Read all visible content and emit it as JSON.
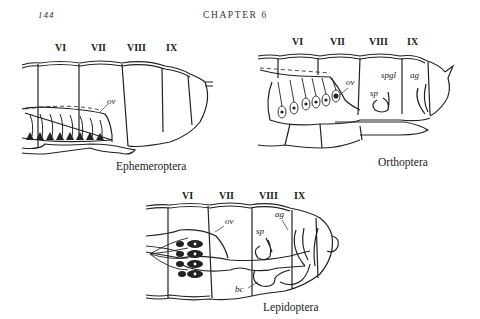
{
  "header": {
    "page_number": "144",
    "chapter_title": "CHAPTER 6"
  },
  "figures": [
    {
      "caption": "Ephemeroptera",
      "segments": [
        "VI",
        "VII",
        "VIII",
        "IX"
      ],
      "labels": {
        "ov": "ov"
      }
    },
    {
      "caption": "Orthoptera",
      "segments": [
        "VI",
        "VII",
        "VIII",
        "IX"
      ],
      "labels": {
        "ov": "ov",
        "spgl": "spgl",
        "sp": "sp",
        "ag": "ag"
      }
    },
    {
      "caption": "Lepidoptera",
      "segments": [
        "VI",
        "VII",
        "VIII",
        "IX"
      ],
      "labels": {
        "ov": "ov",
        "sp": "sp",
        "ag": "ag",
        "bc": "bc"
      }
    }
  ]
}
